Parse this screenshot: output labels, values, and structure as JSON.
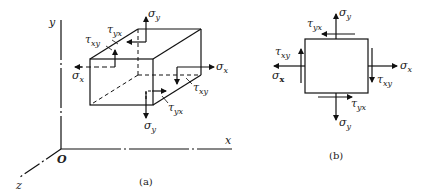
{
  "figure_a": {
    "caption": "(a)",
    "axes": {
      "x": "x",
      "y": "y",
      "z": "z",
      "origin": "O"
    },
    "labels": {
      "sigma_y_top": {
        "sym": "σ",
        "sub": "y"
      },
      "tau_yx_top": {
        "sym": "τ",
        "sub": "yx"
      },
      "tau_xy_left": {
        "sym": "τ",
        "sub": "xy"
      },
      "sigma_x_left": {
        "sym": "σ",
        "sub": "x"
      },
      "sigma_x_right": {
        "sym": "σ",
        "sub": "x"
      },
      "tau_xy_right": {
        "sym": "τ",
        "sub": "xy"
      },
      "tau_yx_bottom": {
        "sym": "τ",
        "sub": "yx"
      },
      "sigma_y_bottom": {
        "sym": "σ",
        "sub": "y"
      }
    }
  },
  "figure_b": {
    "caption": "(b)",
    "labels": {
      "sigma_y_top": {
        "sym": "σ",
        "sub": "y"
      },
      "tau_yx_top": {
        "sym": "τ",
        "sub": "yx"
      },
      "tau_xy_left": {
        "sym": "τ",
        "sub": "xy"
      },
      "sigma_x_left": {
        "sym": "σ",
        "sub": "x"
      },
      "sigma_x_right": {
        "sym": "σ",
        "sub": "x"
      },
      "tau_xy_right": {
        "sym": "τ",
        "sub": "xy"
      },
      "tau_yx_bottom": {
        "sym": "τ",
        "sub": "yx"
      },
      "sigma_y_bottom": {
        "sym": "σ",
        "sub": "y"
      }
    }
  }
}
